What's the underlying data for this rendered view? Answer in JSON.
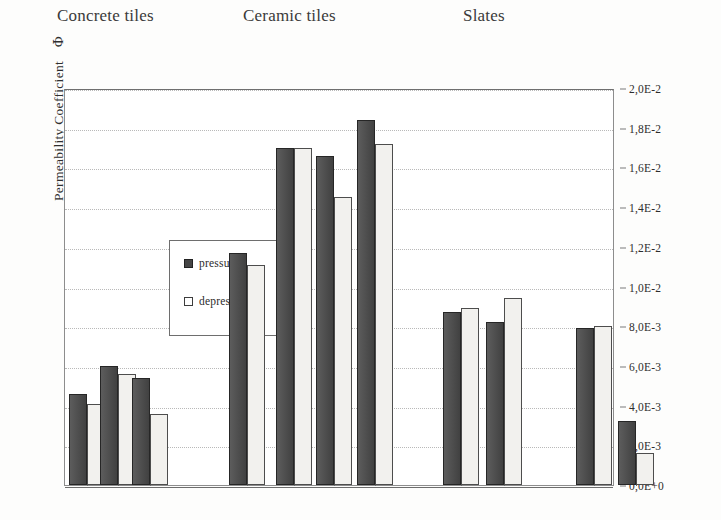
{
  "figure": {
    "y_axis_title": "Permeability Coefficient",
    "y_axis_symbol": "Φ",
    "group_headings": [
      {
        "label": "Concrete tiles",
        "left": 57
      },
      {
        "label": "Ceramic tiles",
        "left": 243
      },
      {
        "label": "Slates",
        "left": 463
      }
    ]
  },
  "legend": {
    "items": [
      {
        "label": "pressure",
        "key": "pressure",
        "color": "#454545"
      },
      {
        "label": "depression",
        "key": "depression",
        "color": "#ffffff"
      }
    ]
  },
  "chart_data": {
    "type": "bar",
    "title": "",
    "xlabel": "",
    "ylabel": "Permeability Coefficient Φ",
    "ylim": [
      0,
      0.02
    ],
    "grid": true,
    "legend_position": "inside-upper-left",
    "y_tick_labels": [
      "0,0E+0",
      "2,0E-3",
      "4,0E-3",
      "6,0E-3",
      "8,0E-3",
      "1,0E-2",
      "1,2E-2",
      "1,4E-2",
      "1,6E-2",
      "1,8E-2",
      "2,0E-2"
    ],
    "y_tick_values": [
      0,
      0.002,
      0.004,
      0.006,
      0.008,
      0.01,
      0.012,
      0.014,
      0.016,
      0.018,
      0.02
    ],
    "groups": [
      {
        "name": "Concrete tiles",
        "samples": [
          {
            "pressure": 0.0046,
            "depression": 0.0041
          },
          {
            "pressure": 0.006,
            "depression": 0.0056
          },
          {
            "pressure": 0.0054,
            "depression": 0.0036
          }
        ]
      },
      {
        "name": "Ceramic tiles",
        "samples": [
          {
            "pressure": 0.0117,
            "depression": 0.0111
          },
          {
            "pressure": 0.017,
            "depression": 0.017
          },
          {
            "pressure": 0.0166,
            "depression": 0.0145
          },
          {
            "pressure": 0.0184,
            "depression": 0.0172
          }
        ]
      },
      {
        "name": "Slates",
        "samples": [
          {
            "pressure": 0.0087,
            "depression": 0.0089
          },
          {
            "pressure": 0.0082,
            "depression": 0.0094
          },
          {
            "pressure": 0.0079,
            "depression": 0.008
          },
          {
            "pressure": 0.0032,
            "depression": 0.0016
          }
        ]
      }
    ],
    "series": [
      {
        "name": "pressure",
        "values": [
          0.0046,
          0.006,
          0.0054,
          0.0117,
          0.017,
          0.0166,
          0.0184,
          0.0087,
          0.0082,
          0.0079,
          0.0032
        ]
      },
      {
        "name": "depression",
        "values": [
          0.0041,
          0.0056,
          0.0036,
          0.0111,
          0.017,
          0.0145,
          0.0172,
          0.0089,
          0.0094,
          0.008,
          0.0016
        ]
      }
    ],
    "bar_layout": [
      {
        "group": 0,
        "pressure_left": 68,
        "depression_left": 86,
        "width": 18
      },
      {
        "group": 0,
        "pressure_left": 99,
        "depression_left": 117,
        "width": 18
      },
      {
        "group": 0,
        "pressure_left": 131,
        "depression_left": 149,
        "width": 18
      },
      {
        "group": 1,
        "pressure_left": 228,
        "depression_left": 246,
        "width": 18
      },
      {
        "group": 1,
        "pressure_left": 275,
        "depression_left": 293,
        "width": 18
      },
      {
        "group": 1,
        "pressure_left": 315,
        "depression_left": 333,
        "width": 18
      },
      {
        "group": 1,
        "pressure_left": 356,
        "depression_left": 374,
        "width": 18
      },
      {
        "group": 2,
        "pressure_left": 442,
        "depression_left": 460,
        "width": 18
      },
      {
        "group": 2,
        "pressure_left": 485,
        "depression_left": 503,
        "width": 18
      },
      {
        "group": 2,
        "pressure_left": 575,
        "depression_left": 593,
        "width": 18
      },
      {
        "group": 2,
        "pressure_left": 617,
        "depression_left": 635,
        "width": 18
      }
    ]
  }
}
